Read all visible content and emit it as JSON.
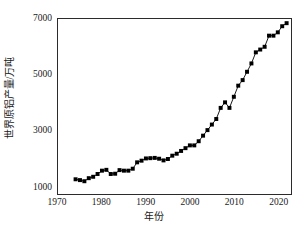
{
  "chart_data": {
    "type": "line",
    "title": "",
    "subtitle": "",
    "xlabel": "年份",
    "ylabel": "世界原铝产量/万吨",
    "xlim": [
      1970,
      2023
    ],
    "ylim": [
      700,
      7000
    ],
    "grid": false,
    "legend": null,
    "marker": "filled-square",
    "line_color": "#000000",
    "marker_color": "#000000",
    "x_ticks_major": [
      1970,
      1980,
      1990,
      2000,
      2010,
      2020
    ],
    "x_tick_labels": [
      "1970",
      "1980",
      "1990",
      "2000",
      "2010",
      "2020"
    ],
    "x_ticks_minor": [
      1975,
      1985,
      1995,
      2005,
      2015
    ],
    "y_ticks_major": [
      1000,
      3000,
      5000,
      7000
    ],
    "y_tick_labels": [
      "1000",
      "3000",
      "5000",
      "7000"
    ],
    "y_ticks_minor": [
      2000,
      4000,
      6000
    ],
    "series": [
      {
        "name": "世界原铝产量",
        "x": [
          1974,
          1975,
          1976,
          1977,
          1978,
          1979,
          1980,
          1981,
          1982,
          1983,
          1984,
          1985,
          1986,
          1987,
          1988,
          1989,
          1990,
          1991,
          1992,
          1993,
          1994,
          1995,
          1996,
          1997,
          1998,
          1999,
          2000,
          2001,
          2002,
          2003,
          2004,
          2005,
          2006,
          2007,
          2008,
          2009,
          2010,
          2011,
          2012,
          2013,
          2014,
          2015,
          2016,
          2017,
          2018,
          2019,
          2020,
          2021,
          2022
        ],
        "values": [
          1230,
          1200,
          1160,
          1270,
          1320,
          1420,
          1540,
          1570,
          1420,
          1430,
          1560,
          1540,
          1540,
          1610,
          1840,
          1900,
          1980,
          1990,
          2000,
          1970,
          1910,
          1960,
          2080,
          2150,
          2250,
          2350,
          2450,
          2450,
          2600,
          2800,
          3000,
          3200,
          3400,
          3800,
          4000,
          3800,
          4200,
          4600,
          4800,
          5100,
          5400,
          5800,
          5900,
          6000,
          6400,
          6400,
          6520,
          6740,
          6850
        ]
      }
    ]
  },
  "axes": {
    "y_label_text": "世界原铝产量/万吨",
    "x_label_text": "年份"
  }
}
